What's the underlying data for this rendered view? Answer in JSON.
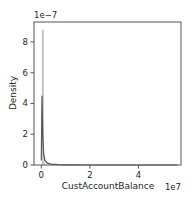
{
  "chart_data": {
    "type": "histogram+kde",
    "title": "",
    "xlabel": "CustAccountBalance",
    "ylabel": "Density",
    "x_offset_label": "1e7",
    "y_offset_label": "1e−7",
    "xlim": [
      -0.3,
      5.75
    ],
    "ylim": [
      0,
      9.3
    ],
    "x_ticks": [
      0,
      2,
      4
    ],
    "x_tick_labels": [
      "0",
      "2",
      "4"
    ],
    "y_ticks": [
      0,
      2,
      4,
      6,
      8
    ],
    "y_tick_labels": [
      "0",
      "2",
      "4",
      "6",
      "8"
    ],
    "grid": false,
    "legend": null,
    "series": [
      {
        "name": "histogram",
        "style": "bar",
        "color": "#c8c8c8",
        "x": [
          0.0,
          0.1,
          0.2,
          0.5,
          1.0,
          5.6
        ],
        "values": [
          8.8,
          0.6,
          0.1,
          0.02,
          0.01,
          0.0
        ]
      },
      {
        "name": "kde",
        "style": "line",
        "color": "#555555",
        "x": [
          0.0,
          0.03,
          0.06,
          0.1,
          0.15,
          0.25,
          0.4,
          0.7,
          1.0,
          2.0,
          4.0,
          5.6
        ],
        "values": [
          0.3,
          4.5,
          2.0,
          0.7,
          0.3,
          0.12,
          0.05,
          0.02,
          0.01,
          0.0,
          0.0,
          0.0
        ]
      }
    ]
  }
}
